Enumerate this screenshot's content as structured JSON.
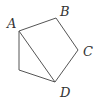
{
  "diagram": {
    "type": "geometry-figure",
    "vertices": [
      {
        "id": "A",
        "label": "A"
      },
      {
        "id": "B",
        "label": "B"
      },
      {
        "id": "C",
        "label": "C"
      },
      {
        "id": "D",
        "label": "D"
      },
      {
        "id": "E",
        "label": ""
      }
    ],
    "edges": [
      [
        "A",
        "B"
      ],
      [
        "B",
        "C"
      ],
      [
        "C",
        "D"
      ],
      [
        "D",
        "E"
      ],
      [
        "E",
        "A"
      ],
      [
        "A",
        "D"
      ]
    ],
    "line_color": "#555555",
    "label_color": "#333333"
  }
}
